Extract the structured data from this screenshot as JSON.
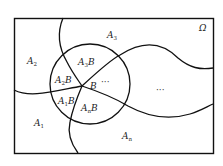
{
  "diagram": {
    "type": "venn-partition",
    "universe_label": "Ω",
    "central_set": "B",
    "center_label": "B",
    "outer_regions": [
      {
        "name": "A",
        "sub": "1"
      },
      {
        "name": "A",
        "sub": "2"
      },
      {
        "name": "A",
        "sub": "3"
      },
      {
        "name": "A",
        "sub": "n"
      }
    ],
    "inner_regions": [
      {
        "name": "A",
        "sub": "1",
        "suffix": "B"
      },
      {
        "name": "A",
        "sub": "2",
        "suffix": "B"
      },
      {
        "name": "A",
        "sub": "3",
        "suffix": "B"
      },
      {
        "name": "A",
        "sub": "n",
        "suffix": "B"
      }
    ],
    "ellipsis_inner": "···",
    "ellipsis_outer": "···"
  }
}
